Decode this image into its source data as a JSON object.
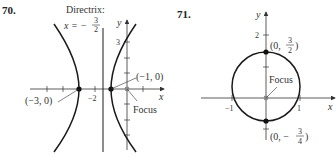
{
  "problems": [
    {
      "number": "70.",
      "directrix_label": "Directrix:",
      "directrix_eq_lhs": "x = −",
      "directrix_frac_num": "3",
      "directrix_frac_den": "2",
      "axis_x": "x",
      "axis_y": "y",
      "tick_y3": "3",
      "tick_xm2": "−2",
      "point_left": "(−3, 0)",
      "point_right": "(−1, 0)",
      "focus_label": "Focus"
    },
    {
      "number": "71.",
      "axis_x": "x",
      "axis_y": "y",
      "tick_y2": "2",
      "tick_xm1": "−1",
      "tick_x1": "1",
      "point_top_prefix": "(0, ",
      "point_top_num": "3",
      "point_top_den": "2",
      "point_top_suffix": ")",
      "point_bottom_prefix": "(0, −",
      "point_bottom_num": "3",
      "point_bottom_den": "4",
      "point_bottom_suffix": ")",
      "focus_label": "Focus"
    }
  ],
  "colors": {
    "curve": "#1a1a1a",
    "axis": "#333333",
    "focus_dot": "#888888",
    "vertex_dot": "#111111"
  }
}
